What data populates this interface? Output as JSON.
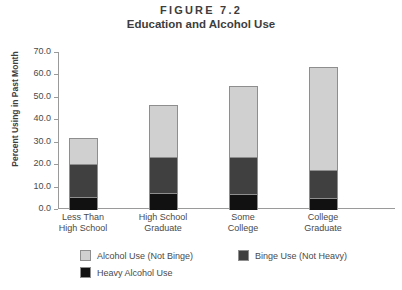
{
  "chart_data": {
    "type": "bar",
    "subtype": "stacked",
    "title": "FIGURE 7.2",
    "subtitle": "Education and Alcohol Use",
    "xlabel": "",
    "ylabel": "Percent Using in Past Month",
    "ylim": [
      0,
      70
    ],
    "ytick_step": 10,
    "ytick_labels": [
      "0.0",
      "10.0",
      "20.0",
      "30.0",
      "40.0",
      "50.0",
      "60.0",
      "70.0"
    ],
    "ytick_values": [
      0,
      10,
      20,
      30,
      40,
      50,
      60,
      70
    ],
    "grid": false,
    "legend_position": "bottom-left",
    "categories": [
      "Less Than High School",
      "High School Graduate",
      "Some College",
      "College Graduate"
    ],
    "category_lines": [
      [
        "Less Than",
        "High School"
      ],
      [
        "High School",
        "Graduate"
      ],
      [
        "Some",
        "College"
      ],
      [
        "College",
        "Graduate"
      ]
    ],
    "series": [
      {
        "name": "Heavy Alcohol Use",
        "color": "#111111",
        "values": [
          6.0,
          7.5,
          7.0,
          5.5
        ]
      },
      {
        "name": "Binge Use (Not Heavy)",
        "color": "#404040",
        "values": [
          15.0,
          16.5,
          17.0,
          13.0
        ]
      },
      {
        "name": "Alcohol Use (Not Binge)",
        "color": "#d0d0d0",
        "values": [
          12.0,
          23.5,
          32.0,
          46.0
        ]
      }
    ],
    "totals": [
      33.0,
      47.5,
      56.0,
      64.5
    ]
  },
  "legend": {
    "entries": [
      {
        "label": "Alcohol Use (Not Binge)",
        "color": "#d0d0d0"
      },
      {
        "label": "Binge Use (Not Heavy)",
        "color": "#404040"
      },
      {
        "label": "Heavy Alcohol Use",
        "color": "#111111"
      }
    ]
  }
}
